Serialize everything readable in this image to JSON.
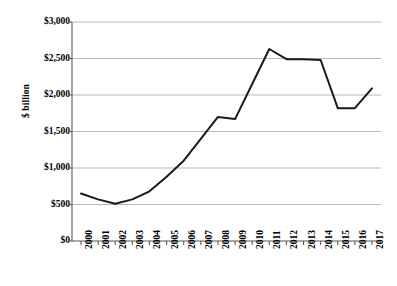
{
  "chart_data": {
    "type": "line",
    "title": "",
    "xlabel": "",
    "ylabel": "$ billion",
    "ylim": [
      0,
      3000
    ],
    "ytick_values": [
      0,
      500,
      1000,
      1500,
      2000,
      2500,
      3000
    ],
    "ytick_labels": [
      "$0",
      "$500",
      "$1,000",
      "$1,500",
      "$2,000",
      "$2,500",
      "$3,000"
    ],
    "grid": true,
    "grid_axis": "y",
    "legend": false,
    "legend_position": "none",
    "line_color": "#1a1a1a",
    "grid_color": "#a6a6a6",
    "axis_color": "#595959",
    "categories": [
      "2000",
      "2001",
      "2002",
      "2003",
      "2004",
      "2005",
      "2006",
      "2007",
      "2008",
      "2009",
      "2010",
      "2011",
      "2012",
      "2013",
      "2014",
      "2015",
      "2016",
      "2017"
    ],
    "values": [
      650,
      570,
      510,
      570,
      680,
      880,
      1100,
      1400,
      1700,
      1670,
      2150,
      2630,
      2490,
      2490,
      2480,
      1820,
      1820,
      2090
    ],
    "units": "$ billion"
  }
}
